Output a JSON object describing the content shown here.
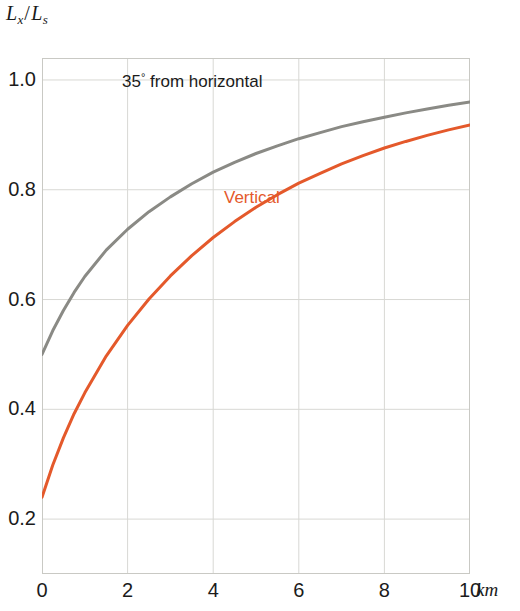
{
  "chart_data": {
    "type": "line",
    "title": "",
    "ylabel": "Lx/Ls",
    "ylabel_parts": {
      "num_base": "L",
      "num_sub": "x",
      "slash": "/",
      "den_base": "L",
      "den_sub": "s"
    },
    "xlabel": "km",
    "x_unit": "km",
    "xlim": [
      0,
      10
    ],
    "ylim": [
      0.1,
      1.04
    ],
    "grid": true,
    "grid_color": "#d8d8d4",
    "frame_color": "#c9c9c4",
    "legend": "inline-annotations",
    "xticks": [
      0,
      2,
      4,
      6,
      8,
      10
    ],
    "xtick_labels": [
      "0",
      "2",
      "4",
      "6",
      "8",
      "10"
    ],
    "yticks": [
      0.2,
      0.4,
      0.6,
      0.8,
      1.0
    ],
    "ytick_labels": [
      "0.2",
      "0.4",
      "0.6",
      "0.8",
      "1.0"
    ],
    "x": [
      0,
      0.25,
      0.5,
      0.75,
      1,
      1.5,
      2,
      2.5,
      3,
      3.5,
      4,
      4.5,
      5,
      5.5,
      6,
      6.5,
      7,
      7.5,
      8,
      8.5,
      9,
      9.5,
      10
    ],
    "series": [
      {
        "name": "35 deg from horizontal",
        "label": "35° from horizontal",
        "color": "#8a8a85",
        "width": 3,
        "values": [
          0.5,
          0.543,
          0.58,
          0.613,
          0.642,
          0.69,
          0.728,
          0.76,
          0.787,
          0.811,
          0.832,
          0.85,
          0.866,
          0.88,
          0.893,
          0.904,
          0.915,
          0.924,
          0.932,
          0.94,
          0.947,
          0.954,
          0.96
        ]
      },
      {
        "name": "Vertical",
        "label": "Vertical",
        "color": "#E4592B",
        "width": 3,
        "values": [
          0.24,
          0.298,
          0.348,
          0.392,
          0.43,
          0.497,
          0.553,
          0.601,
          0.643,
          0.68,
          0.713,
          0.742,
          0.768,
          0.791,
          0.812,
          0.83,
          0.847,
          0.862,
          0.876,
          0.888,
          0.899,
          0.909,
          0.918
        ]
      }
    ],
    "annotations": [
      {
        "name": "angle-curve-label",
        "text": "35° from horizontal",
        "color": "#1b1b1b",
        "data_x": 1.9,
        "data_y": 0.975
      },
      {
        "name": "vertical-curve-label",
        "text": "Vertical",
        "color": "#E4592B",
        "data_x": 4.25,
        "data_y": 0.755
      }
    ]
  },
  "axis": {
    "y_title_num_base": "L",
    "y_title_num_sub": "x",
    "y_title_slash": "/",
    "y_title_den_base": "L",
    "y_title_den_sub": "s",
    "x_unit_label": "km"
  },
  "labels": {
    "angle_prefix": "35",
    "angle_degree": "°",
    "angle_suffix": " from horizontal",
    "vertical": "Vertical"
  }
}
